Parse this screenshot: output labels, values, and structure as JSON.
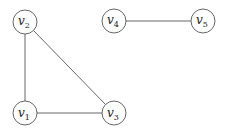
{
  "graph": {
    "nodes": [
      {
        "id": "v1",
        "base": "v",
        "sub": "1",
        "x": 25,
        "y": 113
      },
      {
        "id": "v2",
        "base": "v",
        "sub": "2",
        "x": 25,
        "y": 22
      },
      {
        "id": "v3",
        "base": "v",
        "sub": "3",
        "x": 114,
        "y": 113
      },
      {
        "id": "v4",
        "base": "v",
        "sub": "4",
        "x": 114,
        "y": 21
      },
      {
        "id": "v5",
        "base": "v",
        "sub": "5",
        "x": 203,
        "y": 21
      }
    ],
    "edges": [
      {
        "from": "v1",
        "to": "v2"
      },
      {
        "from": "v1",
        "to": "v3"
      },
      {
        "from": "v2",
        "to": "v3"
      },
      {
        "from": "v4",
        "to": "v5"
      }
    ],
    "node_radius": 12
  }
}
